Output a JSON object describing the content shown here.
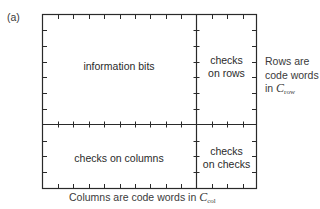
{
  "figure": {
    "panel_label": "(a)",
    "regions": {
      "information": "information bits",
      "row_checks_line1": "checks",
      "row_checks_line2": "on rows",
      "column_checks": "checks on columns",
      "checks_on_checks_line1": "checks",
      "checks_on_checks_line2": "on checks"
    },
    "right_caption": {
      "line1": "Rows are",
      "line2": "code words",
      "line3_prefix": "in ",
      "symbol": "C",
      "subscript": "row"
    },
    "bottom_caption": {
      "prefix": "Columns are code words in ",
      "symbol": "C",
      "subscript": "col"
    },
    "colors": {
      "line": "#2a2a2a",
      "background": "#ffffff"
    }
  }
}
